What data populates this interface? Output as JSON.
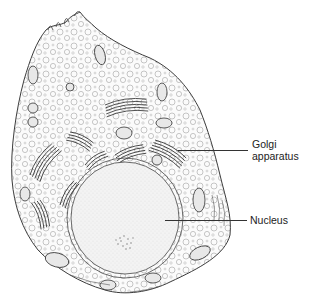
{
  "figure": {
    "labels": [
      {
        "id": "golgi",
        "line1": "Golgi",
        "line2": "apparatus"
      },
      {
        "id": "nucleus",
        "line1": "Nucleus"
      }
    ]
  },
  "colors": {
    "background": "#ffffff",
    "stroke": "#3a3a3a",
    "nucleus_fill": "#f1f1f1",
    "cytoplasm_fill": "#fafafa"
  }
}
